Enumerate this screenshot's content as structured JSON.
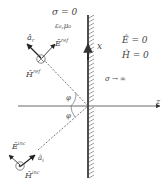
{
  "medium_left": {
    "conductivity": "σ = 0",
    "params": "ε₀,μ₀"
  },
  "medium_right": {
    "e_field": "Ê = 0",
    "h_field": "Ĥ = 0",
    "conductivity": "σ → ∞"
  },
  "axes": {
    "x_label": "x",
    "z_label": "z"
  },
  "reflected": {
    "unit_vector": "âr",
    "unit_vector_base": "â",
    "unit_vector_sub": "r",
    "e_label_base": "Ê",
    "e_label_sup": "ref",
    "h_label_base": "Ĥ",
    "h_label_sup": "ref",
    "h_symbol": "into-page (⊗)"
  },
  "incident": {
    "unit_vector_base": "â",
    "unit_vector_sub": "i",
    "e_label_base": "Ê",
    "e_label_sup": "inc",
    "h_label_base": "Ĥ",
    "h_label_sup": "inc",
    "h_symbol": "out-of-page (⊙)"
  },
  "angles": {
    "reflected": "φ",
    "incident": "φ"
  },
  "colors": {
    "line": "#333333",
    "dashed": "#555555",
    "text": "#444444",
    "background": "#ffffff"
  }
}
